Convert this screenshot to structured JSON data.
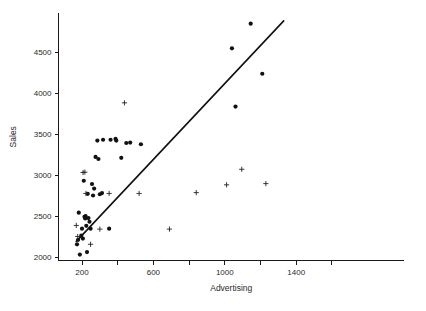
{
  "chart_data": {
    "type": "scatter",
    "title": "",
    "xlabel": "Advertising",
    "ylabel": "Sales",
    "xlim": [
      130,
      1600
    ],
    "ylim": [
      2000,
      4900
    ],
    "grid": false,
    "legend": null,
    "x_ticks": [
      200,
      400,
      600,
      800,
      1000,
      1200,
      1400,
      1600
    ],
    "x_tick_labels": [
      "200",
      "",
      "600",
      "",
      "1000",
      "",
      "1400",
      ""
    ],
    "y_ticks": [
      2000,
      2500,
      3000,
      3500,
      4000,
      4500
    ],
    "y_tick_labels": [
      "2000",
      "2500",
      "3000",
      "3500",
      "4000",
      "4500"
    ],
    "series": [
      {
        "name": "observations-filled",
        "marker": "filled-circle",
        "color": "#111111",
        "points": [
          [
            172,
            2155
          ],
          [
            178,
            2210
          ],
          [
            182,
            2540
          ],
          [
            188,
            2030
          ],
          [
            196,
            2260
          ],
          [
            200,
            2345
          ],
          [
            205,
            2225
          ],
          [
            210,
            2930
          ],
          [
            214,
            2490
          ],
          [
            218,
            2470
          ],
          [
            220,
            2500
          ],
          [
            224,
            2380
          ],
          [
            228,
            2060
          ],
          [
            232,
            2770
          ],
          [
            236,
            2475
          ],
          [
            242,
            2430
          ],
          [
            248,
            2345
          ],
          [
            256,
            2890
          ],
          [
            262,
            2750
          ],
          [
            268,
            2835
          ],
          [
            276,
            3220
          ],
          [
            286,
            3420
          ],
          [
            292,
            3195
          ],
          [
            300,
            2765
          ],
          [
            312,
            2780
          ],
          [
            318,
            3430
          ],
          [
            352,
            2345
          ],
          [
            360,
            3430
          ],
          [
            388,
            3440
          ],
          [
            392,
            3420
          ],
          [
            420,
            3210
          ],
          [
            448,
            3390
          ],
          [
            470,
            3395
          ],
          [
            530,
            3375
          ],
          [
            1040,
            4545
          ],
          [
            1145,
            4845
          ],
          [
            1210,
            4235
          ],
          [
            1060,
            3835
          ]
        ]
      },
      {
        "name": "observations-cross",
        "marker": "plus",
        "color": "#222222",
        "points": [
          [
            168,
            2385
          ],
          [
            176,
            2250
          ],
          [
            206,
            3030
          ],
          [
            216,
            3035
          ],
          [
            222,
            2775
          ],
          [
            248,
            2155
          ],
          [
            300,
            2340
          ],
          [
            352,
            2775
          ],
          [
            438,
            3880
          ],
          [
            520,
            2775
          ],
          [
            690,
            2340
          ],
          [
            840,
            2785
          ],
          [
            1010,
            2880
          ],
          [
            1095,
            3070
          ],
          [
            1230,
            2895
          ]
        ]
      }
    ],
    "fit_line": {
      "name": "regression-line",
      "x_start": 168,
      "y_start": 2190,
      "x_end": 1330,
      "y_end": 4880,
      "color": "#111111"
    }
  }
}
